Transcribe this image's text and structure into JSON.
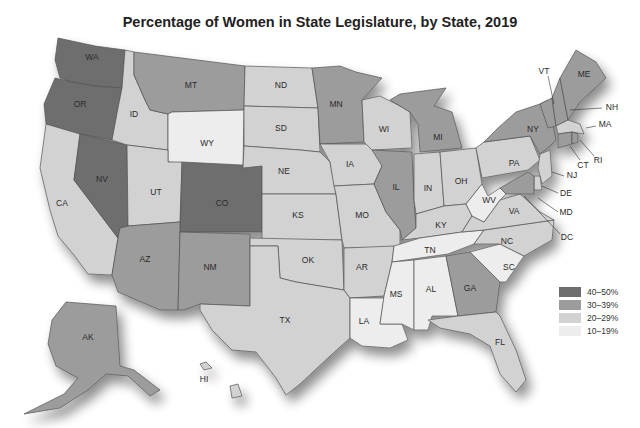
{
  "title": "Percentage of Women in State Legislature, by State, 2019",
  "legend": [
    {
      "label": "40–50%",
      "color": "#6e6e6e",
      "key": "c40"
    },
    {
      "label": "30–39%",
      "color": "#9c9c9c",
      "key": "c30"
    },
    {
      "label": "20–29%",
      "color": "#d2d2d2",
      "key": "c20"
    },
    {
      "label": "10–19%",
      "color": "#ededed",
      "key": "c10"
    }
  ],
  "states": {
    "WA": {
      "label": "WA",
      "category": "c40"
    },
    "OR": {
      "label": "OR",
      "category": "c40"
    },
    "CA": {
      "label": "CA",
      "category": "c20"
    },
    "NV": {
      "label": "NV",
      "category": "c40"
    },
    "ID": {
      "label": "ID",
      "category": "c20"
    },
    "MT": {
      "label": "MT",
      "category": "c30"
    },
    "WY": {
      "label": "WY",
      "category": "c10"
    },
    "UT": {
      "label": "UT",
      "category": "c20"
    },
    "CO": {
      "label": "CO",
      "category": "c40"
    },
    "AZ": {
      "label": "AZ",
      "category": "c30"
    },
    "NM": {
      "label": "NM",
      "category": "c30"
    },
    "ND": {
      "label": "ND",
      "category": "c20"
    },
    "SD": {
      "label": "SD",
      "category": "c20"
    },
    "NE": {
      "label": "NE",
      "category": "c20"
    },
    "KS": {
      "label": "KS",
      "category": "c20"
    },
    "OK": {
      "label": "OK",
      "category": "c20"
    },
    "TX": {
      "label": "TX",
      "category": "c20"
    },
    "MN": {
      "label": "MN",
      "category": "c30"
    },
    "IA": {
      "label": "IA",
      "category": "c20"
    },
    "MO": {
      "label": "MO",
      "category": "c20"
    },
    "AR": {
      "label": "AR",
      "category": "c20"
    },
    "LA": {
      "label": "LA",
      "category": "c10"
    },
    "WI": {
      "label": "WI",
      "category": "c20"
    },
    "IL": {
      "label": "IL",
      "category": "c30"
    },
    "MI": {
      "label": "MI",
      "category": "c30"
    },
    "IN": {
      "label": "IN",
      "category": "c20"
    },
    "OH": {
      "label": "OH",
      "category": "c20"
    },
    "KY": {
      "label": "KY",
      "category": "c20"
    },
    "TN": {
      "label": "TN",
      "category": "c10"
    },
    "MS": {
      "label": "MS",
      "category": "c10"
    },
    "AL": {
      "label": "AL",
      "category": "c10"
    },
    "GA": {
      "label": "GA",
      "category": "c30"
    },
    "FL": {
      "label": "FL",
      "category": "c20"
    },
    "SC": {
      "label": "SC",
      "category": "c10"
    },
    "NC": {
      "label": "NC",
      "category": "c20"
    },
    "VA": {
      "label": "VA",
      "category": "c20"
    },
    "WV": {
      "label": "WV",
      "category": "c10"
    },
    "PA": {
      "label": "PA",
      "category": "c20"
    },
    "NY": {
      "label": "NY",
      "category": "c30"
    },
    "VT": {
      "label": "VT",
      "category": "c30"
    },
    "NH": {
      "label": "NH",
      "category": "c30"
    },
    "ME": {
      "label": "ME",
      "category": "c30"
    },
    "MA": {
      "label": "MA",
      "category": "c20"
    },
    "RI": {
      "label": "RI",
      "category": "c30"
    },
    "CT": {
      "label": "CT",
      "category": "c30"
    },
    "NJ": {
      "label": "NJ",
      "category": "c20"
    },
    "DE": {
      "label": "DE",
      "category": "c20"
    },
    "MD": {
      "label": "MD",
      "category": "c30"
    },
    "DC": {
      "label": "DC",
      "category": "c20"
    },
    "AK": {
      "label": "AK",
      "category": "c30"
    },
    "HI": {
      "label": "HI",
      "category": "c20"
    }
  }
}
